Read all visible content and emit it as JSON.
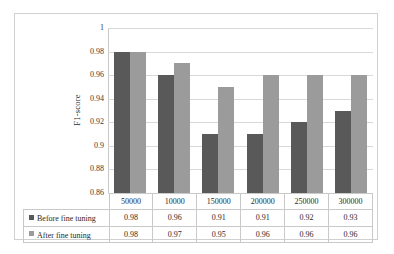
{
  "chart_data": {
    "type": "bar",
    "title": "",
    "xlabel": "",
    "ylabel": "F1-score",
    "ylim": [
      0.86,
      1
    ],
    "ytick_labels": [
      "1",
      "0.98",
      "0.96",
      "0.94",
      "0.92",
      "0.9",
      "0.88",
      "0.86"
    ],
    "ytick_values": [
      1,
      0.98,
      0.96,
      0.94,
      0.92,
      0.9,
      0.88,
      0.86
    ],
    "grid": true,
    "legend_position": "data-table-below",
    "categories": [
      "50000",
      "10000",
      "150000",
      "200000",
      "250000",
      "300000"
    ],
    "series": [
      {
        "name": "Before fine tuning",
        "color": "#595959",
        "values": [
          0.98,
          0.96,
          0.91,
          0.91,
          0.92,
          0.93
        ],
        "value_labels": [
          "0.98",
          "0.96",
          "0.91",
          "0.91",
          "0.92",
          "0.93"
        ]
      },
      {
        "name": "After fine tuning",
        "color": "#9b9b9b",
        "values": [
          0.98,
          0.97,
          0.95,
          0.96,
          0.96,
          0.96
        ],
        "value_labels": [
          "0.98",
          "0.97",
          "0.95",
          "0.96",
          "0.96",
          "0.96"
        ]
      }
    ]
  },
  "colors": {
    "series_before": "#595959",
    "series_after": "#9b9b9b",
    "gridline": "#d9d9d9",
    "frame_border": "#d0d0d0",
    "table_border": "#c9c9c9",
    "background": "#ffffff"
  }
}
